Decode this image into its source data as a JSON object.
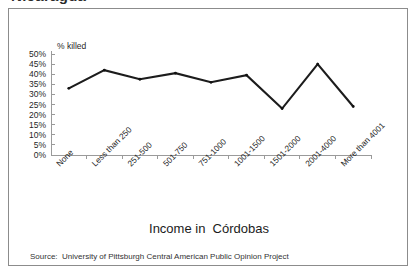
{
  "page": {
    "clipped_heading": "Nicaragua"
  },
  "figure": {
    "xaxis_title": "Income in  Córdobas",
    "source_note": "Source:  University of Pittsburgh Central American Public Opinion Project"
  },
  "chart_data": {
    "type": "line",
    "title": "",
    "subtitle": "",
    "xlabel": "Income in  Córdobas",
    "ylabel": "% killed",
    "ylim": [
      0,
      50
    ],
    "ytick_labels": [
      "0%",
      "5%",
      "10%",
      "15%",
      "20%",
      "25%",
      "30%",
      "35%",
      "40%",
      "45%",
      "50%"
    ],
    "ytick_values": [
      0,
      5,
      10,
      15,
      20,
      25,
      30,
      35,
      40,
      45,
      50
    ],
    "grid": false,
    "legend": "none",
    "categories": [
      "None",
      "Less than 250",
      "251-500",
      "501-750",
      "751-1000",
      "1001-1500",
      "1501-2000",
      "2001-4000",
      "More than 4001"
    ],
    "series": [
      {
        "name": "% killed",
        "values": [
          33,
          42,
          37.5,
          40.5,
          36,
          39.5,
          23,
          45,
          24
        ],
        "color": "#1c1c1c"
      }
    ]
  },
  "colors": {
    "line": "#1c1c1c",
    "axis": "#9a9a9a",
    "frame": "#8c8c8c",
    "text": "#1b1b1b"
  }
}
